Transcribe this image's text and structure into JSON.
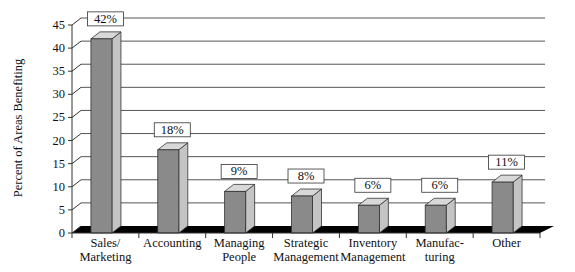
{
  "chart_data": {
    "type": "bar",
    "style": "3d-column",
    "title": "",
    "xlabel": "",
    "ylabel": "Percent of Areas Benefiting",
    "ylim": [
      0,
      45
    ],
    "yticks": [
      0,
      5,
      10,
      15,
      20,
      25,
      30,
      35,
      40,
      45
    ],
    "grid": true,
    "legend": null,
    "categories": [
      "Sales/ Marketing",
      "Accounting",
      "Managing People",
      "Strategic Management",
      "Inventory Management",
      "Manufac- turing",
      "Other"
    ],
    "category_lines": [
      [
        "Sales/",
        "Marketing"
      ],
      [
        "Accounting"
      ],
      [
        "Managing",
        "People"
      ],
      [
        "Strategic",
        "Management"
      ],
      [
        "Inventory",
        "Management"
      ],
      [
        "Manufac-",
        "turing"
      ],
      [
        "Other"
      ]
    ],
    "values": [
      42,
      18,
      9,
      8,
      6,
      6,
      11
    ],
    "data_labels": [
      "42%",
      "18%",
      "9%",
      "8%",
      "6%",
      "6%",
      "11%"
    ]
  },
  "colors": {
    "bar_front": "#8a8a8a",
    "bar_side": "#c4c4c4",
    "bar_top": "#d8d8d8",
    "floor": "#000000",
    "grid": "#555555"
  }
}
